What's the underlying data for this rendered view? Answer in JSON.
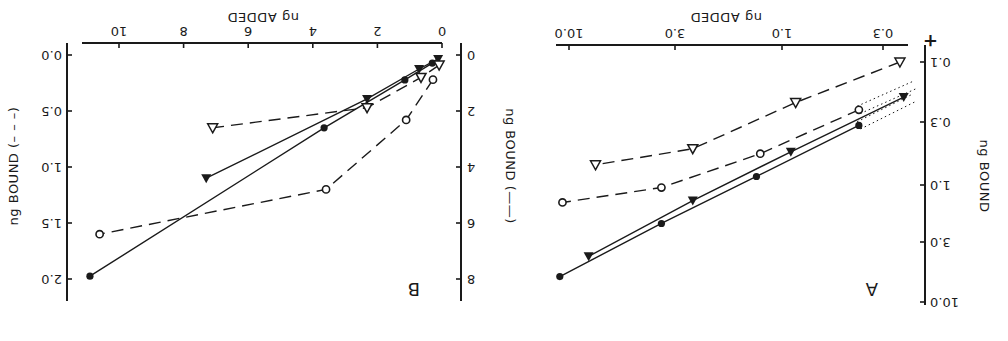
{
  "figure": {
    "orientation": "rotated-180",
    "plus_mark": "+"
  },
  "chart_data": [
    {
      "panel": "A",
      "type": "line",
      "scale": "log-log",
      "xlabel": "ng ADDED",
      "ylabel": "ng BOUND",
      "x_ticks": [
        "0.3",
        "1.0",
        "3.0",
        "10.0"
      ],
      "y_ticks": [
        "0.1",
        "0.3",
        "1.0",
        "3.0",
        "10.0"
      ],
      "xlim": [
        0.22,
        12
      ],
      "ylim": [
        0.09,
        11
      ],
      "grid": false,
      "series": [
        {
          "name": "open-triangle",
          "marker": "open-triangle-down",
          "line": "dashed",
          "x": [
            0.25,
            0.85,
            2.5,
            7.4
          ],
          "y": [
            0.1,
            0.21,
            0.5,
            0.68
          ]
        },
        {
          "name": "open-circle",
          "marker": "open-circle",
          "line": "dashed",
          "extension": "dotted",
          "x": [
            0.4,
            1.25,
            3.5,
            10.7
          ],
          "y": [
            0.24,
            0.55,
            1.05,
            1.4
          ]
        },
        {
          "name": "filled-triangle",
          "marker": "filled-triangle-down",
          "line": "solid",
          "x": [
            0.24,
            0.9,
            2.5,
            8.0
          ],
          "y": [
            0.19,
            0.53,
            1.35,
            4.0
          ]
        },
        {
          "name": "filled-circle",
          "marker": "filled-circle",
          "line": "solid",
          "extension": "dotted",
          "x": [
            0.4,
            1.3,
            3.5,
            11.0
          ],
          "y": [
            0.32,
            0.85,
            2.1,
            6.0
          ]
        }
      ]
    },
    {
      "panel": "B",
      "type": "line",
      "scale": "linear",
      "xlabel": "ng ADDED",
      "ylabel_left": "ng BOUND (——)",
      "ylabel_right": "ng BOUND (– – –)",
      "x_ticks": [
        "0",
        "2",
        "4",
        "6",
        "8",
        "10"
      ],
      "y_ticks_left": [
        "0",
        "2",
        "4",
        "6",
        "8"
      ],
      "y_ticks_right": [
        "0.0",
        "0.5",
        "1.0",
        "1.5",
        "2.0"
      ],
      "xlim": [
        0,
        11.5
      ],
      "ylim_left": [
        0,
        8.5
      ],
      "ylim_right": [
        0,
        2.1
      ],
      "grid": false,
      "series": [
        {
          "name": "filled-circle",
          "marker": "filled-circle",
          "line": "solid",
          "axis": "left",
          "x": [
            0.3,
            1.15,
            3.65,
            10.9
          ],
          "y": [
            0.29,
            0.89,
            2.6,
            7.9
          ]
        },
        {
          "name": "filled-triangle",
          "marker": "filled-triangle-down",
          "line": "solid",
          "axis": "left",
          "x": [
            0.12,
            0.71,
            2.32,
            7.3
          ],
          "y": [
            0.14,
            0.5,
            1.57,
            4.4
          ]
        },
        {
          "name": "open-triangle",
          "marker": "open-triangle-down",
          "line": "dashed",
          "axis": "right",
          "x": [
            0.09,
            0.65,
            2.32,
            7.1
          ],
          "y": [
            0.09,
            0.2,
            0.47,
            0.65
          ]
        },
        {
          "name": "open-circle",
          "marker": "open-circle",
          "line": "dashed",
          "axis": "right",
          "x": [
            0.28,
            1.11,
            3.59,
            10.6
          ],
          "y": [
            0.22,
            0.58,
            1.2,
            1.6
          ]
        }
      ]
    }
  ]
}
